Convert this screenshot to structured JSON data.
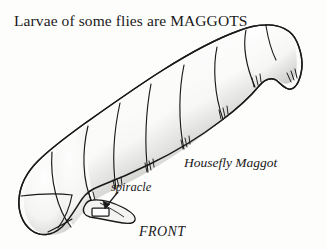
{
  "figure": {
    "title": "Larvae of some flies are MAGGOTS",
    "subject_label": "Housefly Maggot",
    "part_label_spiracle": "spiracle",
    "orientation_label": "FRONT",
    "background_color": "#fdfdfc",
    "ink_color": "#1a1a1a",
    "body_fill_color": "#fbfbfa",
    "shading_color": "#c9c9c6",
    "illustration_name": "housefly-maggot-larva-diagram"
  }
}
